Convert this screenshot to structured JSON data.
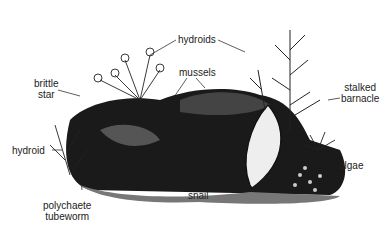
{
  "diagram": {
    "labels": {
      "hydroids": "hydroids",
      "mussels": "mussels",
      "brittle_star_1": "brittle",
      "brittle_star_2": "star",
      "stalked_barnacle_1": "stalked",
      "stalked_barnacle_2": "barnacle",
      "hydroid": "hydroid",
      "polychaete_tubeworm_1": "polychaete",
      "polychaete_tubeworm_2": "tubeworm",
      "snail": "snail",
      "algae": "algae"
    }
  }
}
